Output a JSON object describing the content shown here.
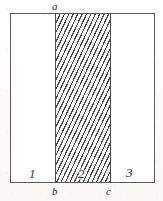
{
  "figure": {
    "type": "geometric-diagram",
    "background_color": "#fdfdfc",
    "ink_color": "#4a4a4a",
    "outline_color": "#5b5b5b"
  },
  "rectangle": {
    "outline_label": "rectangle-outline",
    "fill": "#ffffff"
  },
  "hatching": {
    "pattern": "diagonal-lines",
    "angle_deg": 115,
    "spacing_px": 4,
    "line_color": "#4a4a4a"
  },
  "dividers": [
    {
      "id": "divider-b",
      "at_label": "b"
    },
    {
      "id": "divider-c",
      "at_label": "c"
    }
  ],
  "point_labels": [
    {
      "id": "a",
      "text": "a",
      "position": "top",
      "note": "above top edge at the left boundary of the hatched strip"
    },
    {
      "id": "b",
      "text": "b",
      "position": "bottom",
      "note": "below bottom edge at the left boundary of the hatched strip"
    },
    {
      "id": "c",
      "text": "c",
      "position": "bottom",
      "note": "below bottom edge at the right boundary of the hatched strip"
    }
  ],
  "regions": [
    {
      "id": "region-1",
      "label": "1",
      "fill": "white"
    },
    {
      "id": "region-2",
      "label": "2",
      "fill": "hatched"
    },
    {
      "id": "region-3",
      "label": "3",
      "fill": "white"
    }
  ]
}
